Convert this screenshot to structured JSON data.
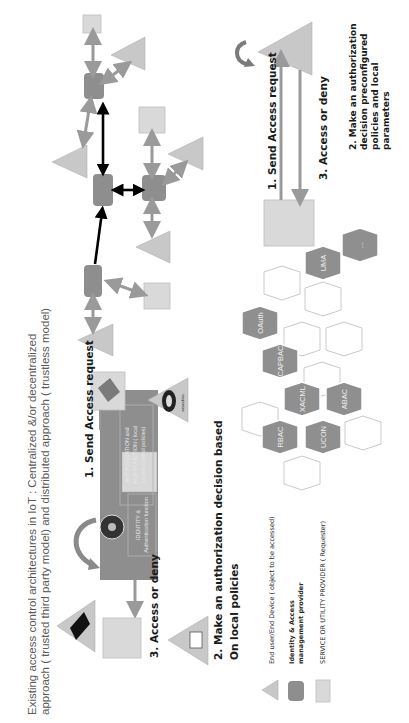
{
  "title": {
    "line1": "Existing  access control architectures in IoT : Centralized &/or decentralized",
    "line2": "approach ( trusted third party model) and distributed approach ( trustless model)"
  },
  "centralized": {
    "step1": "1. Send Access request",
    "step2_line1": "2. Make an authorization decision based",
    "step2_line2": "On local policies",
    "step3": "3. Access or deny",
    "authz_box_line1": "AUTHORIZATION and",
    "authz_box_line2": "ACM FUNCTION ( local",
    "authz_box_line3": "access control policies)",
    "identity_box_line1": "IDENTITY &",
    "identity_box_line2": "Authentication function",
    "wearable_label": "wearables"
  },
  "distributed": {
    "step1": "1. Send Access request",
    "step3": "3. Access or deny",
    "step2_lines": [
      "2. Make an authorization",
      "decision preconfigured",
      "policies and local",
      "parameters"
    ]
  },
  "models": {
    "hexagons": [
      {
        "label": "OAuth",
        "filled": true
      },
      {
        "label": "UMA",
        "filled": true
      },
      {
        "label": "CAPBAC",
        "filled": true
      },
      {
        "label": "XACML",
        "filled": true
      },
      {
        "label": "ABAC",
        "filled": true
      },
      {
        "label": "RBAC",
        "filled": true
      },
      {
        "label": "UCON",
        "filled": true
      },
      {
        "label": "...",
        "filled": true
      }
    ]
  },
  "legend": {
    "items": [
      {
        "icon": "triangle",
        "label": "End user/End Device  ( object to be accessed)"
      },
      {
        "icon": "octagon",
        "label_line1": "Identity & Access",
        "label_line2": "management provider"
      },
      {
        "icon": "square",
        "label": "SERVICE OR UTILITY PROVIDER ( Requester)"
      }
    ]
  },
  "colors": {
    "triangle": "#c8c8c8",
    "square": "#d9d9d9",
    "node": "#8e8e8e",
    "gray_arrow": "#9a9a9a",
    "black_arrow": "#000000"
  }
}
